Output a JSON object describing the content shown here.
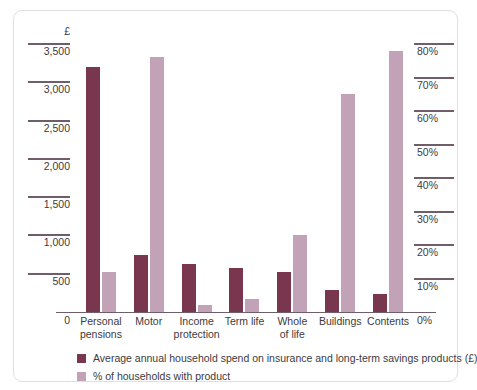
{
  "chart_data": {
    "type": "bar",
    "title": "",
    "subtitle": "",
    "categories": [
      "Personal pensions",
      "Motor",
      "Income protection",
      "Term life",
      "Whole of life",
      "Buildings",
      "Contents"
    ],
    "category_lines": [
      [
        "Personal",
        "pensions"
      ],
      [
        "Motor",
        ""
      ],
      [
        "Income",
        "protection"
      ],
      [
        "Term life",
        ""
      ],
      [
        "Whole",
        "of life"
      ],
      [
        "Buildings",
        ""
      ],
      [
        "Contents",
        ""
      ]
    ],
    "series": [
      {
        "name": "Average annual household spend on insurance and long-term savings products (£)",
        "axis": "left",
        "color": "#78374f",
        "values": [
          3200,
          750,
          630,
          580,
          520,
          290,
          230
        ]
      },
      {
        "name": "% of households with product",
        "axis": "right",
        "color": "#c2a2b6",
        "values": [
          12,
          76,
          2,
          4,
          23,
          65,
          78
        ]
      }
    ],
    "left_axis": {
      "unit": "£",
      "ylim": [
        0,
        3500
      ],
      "tick_values": [
        3500,
        3000,
        2500,
        2000,
        1500,
        1000,
        500,
        0
      ],
      "tick_labels": [
        "3,500",
        "3,000",
        "2,500",
        "2,000",
        "1,500",
        "1,000",
        "500",
        "0"
      ]
    },
    "right_axis": {
      "unit": "%",
      "ylim": [
        0,
        80
      ],
      "tick_values": [
        80,
        70,
        60,
        50,
        40,
        30,
        20,
        10,
        0
      ],
      "tick_labels": [
        "80%",
        "70%",
        "60%",
        "50%",
        "40%",
        "30%",
        "20%",
        "10%",
        "0%"
      ]
    },
    "grid": false,
    "legend_position": "bottom-left"
  },
  "legend": {
    "items": [
      {
        "label": "Average annual household spend on insurance and long-term savings products (£)",
        "color": "#78374f"
      },
      {
        "label": "% of households with product",
        "color": "#c2a2b6"
      }
    ]
  },
  "colors": {
    "spend_bar": "#78374f",
    "pct_bar": "#c2a2b6",
    "axis": "#6f5d6a",
    "text": "#3d3a40",
    "card_border": "#e2dee4"
  }
}
